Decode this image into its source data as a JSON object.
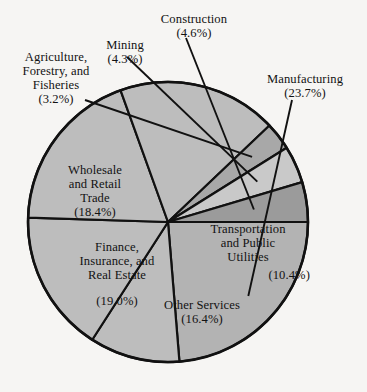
{
  "figure": {
    "background_color": "#f6f5f3",
    "stroke_color": "#111111",
    "width": 367,
    "height": 392
  },
  "chart_data": {
    "type": "pie",
    "title": "",
    "subtitle": "",
    "xlabel": "",
    "ylabel": "",
    "grid": false,
    "legend_position": "none",
    "label_format": "name (percent%)",
    "center": {
      "x": 168,
      "y": 222
    },
    "radius": 140,
    "start_angle_deg": 0,
    "direction": "clockwise",
    "categories": [
      "Manufacturing",
      "Transportation and Public Utilities",
      "Other Services",
      "Finance, Insurance, and Real Estate",
      "Wholesale and Retail Trade",
      "Agriculture, Forestry, and Fisheries",
      "Mining",
      "Construction"
    ],
    "values": [
      23.7,
      10.4,
      16.4,
      19.0,
      18.4,
      3.2,
      4.3,
      4.6
    ],
    "total": 100.0,
    "units": "percent",
    "slices": [
      {
        "name": "Manufacturing",
        "value": 23.7,
        "percent_text": "(23.7%)",
        "color": "#b3b3b3",
        "label_placement": "outside",
        "leader_line": true
      },
      {
        "name": "Transportation and Public Utilities",
        "value": 10.4,
        "percent_text": "(10.4%)",
        "color": "#bdbdbd",
        "label_placement": "inside",
        "leader_line": false
      },
      {
        "name": "Other Services",
        "value": 16.4,
        "percent_text": "(16.4%)",
        "color": "#bdbdbd",
        "label_placement": "inside",
        "leader_line": false
      },
      {
        "name": "Finance, Insurance, and Real Estate",
        "value": 19.0,
        "percent_text": "(19.0%)",
        "color": "#bdbdbd",
        "label_placement": "inside",
        "leader_line": false
      },
      {
        "name": "Wholesale and Retail Trade",
        "value": 18.4,
        "percent_text": "(18.4%)",
        "color": "#bdbdbd",
        "label_placement": "inside",
        "leader_line": false
      },
      {
        "name": "Agriculture, Forestry, and Fisheries",
        "value": 3.2,
        "percent_text": "(3.2%)",
        "color": "#a8a8a8",
        "label_placement": "outside",
        "leader_line": true
      },
      {
        "name": "Mining",
        "value": 4.3,
        "percent_text": "(4.3%)",
        "color": "#c9c9c9",
        "label_placement": "outside",
        "leader_line": true
      },
      {
        "name": "Construction",
        "value": 4.6,
        "percent_text": "(4.6%)",
        "color": "#9b9b9b",
        "label_placement": "outside",
        "leader_line": true
      }
    ]
  },
  "labels": {
    "construction": {
      "line1": "Construction",
      "pct": "(4.6%)"
    },
    "mining": {
      "line1": "Mining",
      "pct": "(4.3%)"
    },
    "agriculture": {
      "line1": "Agriculture,",
      "line2": "Forestry, and",
      "line3": "Fisheries",
      "pct": "(3.2%)"
    },
    "manufacturing": {
      "line1": "Manufacturing",
      "pct": "(23.7%)"
    },
    "wholesale": {
      "line1": "Wholesale",
      "line2": "and Retail",
      "line3": "Trade",
      "pct": "(18.4%)"
    },
    "finance": {
      "line1": "Finance,",
      "line2": "Insurance, and",
      "line3": "Real Estate",
      "pct": "(19.0%)"
    },
    "transport": {
      "line1": "Transportation",
      "line2": "and Public",
      "line3": "Utilities",
      "pct": "(10.4%)"
    },
    "other": {
      "line1": "Other Services",
      "pct": "(16.4%)"
    }
  }
}
